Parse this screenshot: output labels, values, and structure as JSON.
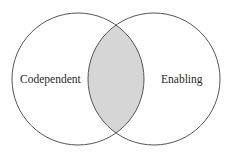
{
  "diagram": {
    "type": "venn",
    "sets": [
      {
        "label": "Codependent",
        "cx": 78,
        "cy": 79,
        "r": 66
      },
      {
        "label": "Enabling",
        "cx": 154,
        "cy": 79,
        "r": 66
      }
    ],
    "intersection_fill": "#d6d6d6",
    "stroke_color": "#555555"
  }
}
